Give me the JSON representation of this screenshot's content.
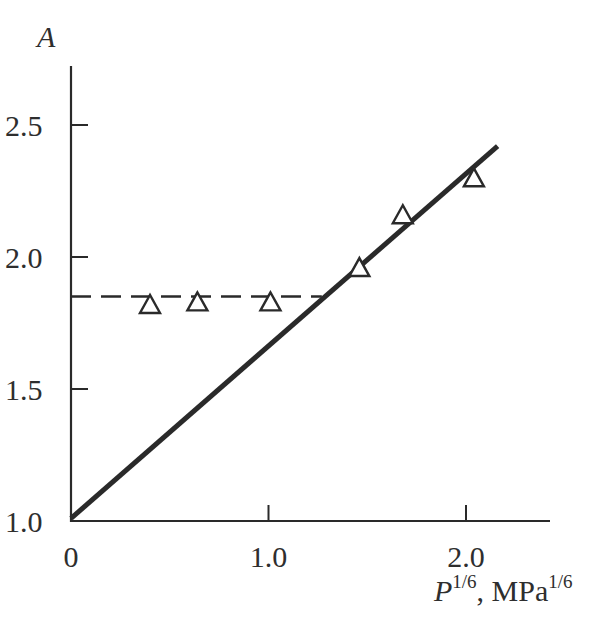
{
  "chart_data": {
    "type": "scatter",
    "title": "",
    "xlabel": "P^{1/6}, MPa^{1/6}",
    "ylabel": "A",
    "xlabel_parts": {
      "var": "P",
      "var_sup": "1/6",
      "unit": ", MPa",
      "unit_sup": "1/6"
    },
    "xlim": [
      0,
      2.4
    ],
    "ylim": [
      1.0,
      2.75
    ],
    "x_ticks": [
      0,
      1.0,
      2.0
    ],
    "x_tick_labels": [
      "0",
      "1.0",
      "2.0"
    ],
    "y_ticks": [
      1.0,
      1.5,
      2.0,
      2.5
    ],
    "y_tick_labels": [
      "1.0",
      "1.5",
      "2.0",
      "2.5"
    ],
    "grid": false,
    "legend": null,
    "series": [
      {
        "name": "measured",
        "marker": "open-triangle",
        "x": [
          0.4,
          0.64,
          1.01,
          1.46,
          1.68,
          2.04
        ],
        "y": [
          1.82,
          1.83,
          1.83,
          1.96,
          2.16,
          2.3
        ]
      },
      {
        "name": "linear fit",
        "style": "solid",
        "x": [
          0.0,
          2.16
        ],
        "y": [
          1.01,
          2.42
        ]
      },
      {
        "name": "plateau",
        "style": "dashed",
        "x": [
          0.0,
          1.27
        ],
        "y": [
          1.85,
          1.85
        ]
      }
    ]
  },
  "labels": {
    "y_axis_title": "A",
    "x_axis_var": "P",
    "x_axis_var_sup": "1/6",
    "x_axis_unit": ", MPa",
    "x_axis_unit_sup": "1/6",
    "x_ticks": [
      "0",
      "1.0",
      "2.0"
    ],
    "y_ticks": [
      "1.0",
      "1.5",
      "2.0",
      "2.5"
    ]
  },
  "colors": {
    "ink": "#2a2a2a",
    "background": "#ffffff"
  }
}
